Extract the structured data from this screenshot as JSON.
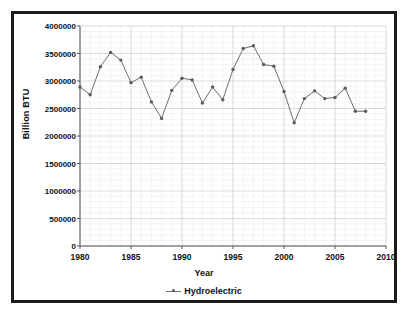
{
  "chart_data": {
    "type": "line",
    "title": "",
    "xlabel": "Year",
    "ylabel": "Billion BTU",
    "xlim": [
      1980,
      2010
    ],
    "ylim": [
      0,
      4000000
    ],
    "xticks": [
      1980,
      1985,
      1990,
      1995,
      2000,
      2005,
      2010
    ],
    "yticks": [
      0,
      500000,
      1000000,
      1500000,
      2000000,
      2500000,
      3000000,
      3500000,
      4000000
    ],
    "ytick_labels": [
      "0",
      "500000",
      "1000000",
      "1500000",
      "2000000",
      "2500000",
      "3000000",
      "3500000",
      "4000000"
    ],
    "xtick_labels": [
      "1980",
      "1985",
      "1990",
      "1995",
      "2000",
      "2005",
      "2010"
    ],
    "grid": true,
    "legend_position": "bottom",
    "series": [
      {
        "name": "Hydroelectric",
        "color": "#6e6e6e",
        "marker": "dot",
        "x": [
          1980,
          1981,
          1982,
          1983,
          1984,
          1985,
          1986,
          1987,
          1988,
          1989,
          1990,
          1991,
          1992,
          1993,
          1994,
          1995,
          1996,
          1997,
          1998,
          1999,
          2000,
          2001,
          2002,
          2003,
          2004,
          2005,
          2006,
          2007,
          2008
        ],
        "values": [
          2890000,
          2750000,
          3260000,
          3520000,
          3380000,
          2970000,
          3070000,
          2620000,
          2320000,
          2830000,
          3050000,
          3020000,
          2600000,
          2890000,
          2660000,
          3210000,
          3590000,
          3640000,
          3300000,
          3270000,
          2810000,
          2240000,
          2680000,
          2820000,
          2680000,
          2700000,
          2870000,
          2450000,
          2450000
        ]
      }
    ]
  },
  "legend": {
    "entry_label": "Hydroelectric",
    "marker_icon": "line-dot-marker-icon"
  },
  "axes": {
    "y_title": "Billion BTU",
    "x_title": "Year"
  },
  "colors": {
    "series": "#6e6e6e",
    "axis": "#555555",
    "grid_major": "#cfcfcf",
    "grid_minor": "#ededed",
    "border": "#1b1b1b",
    "text": "#111111"
  }
}
